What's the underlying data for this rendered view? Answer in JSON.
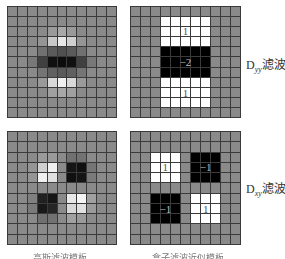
{
  "figure": {
    "panels": [
      {
        "id": "gaussian-dyy",
        "grid_size": 11,
        "base_gray": "#8a8a8a",
        "cells": [
          [
            2,
            4,
            "#9a9a9a"
          ],
          [
            2,
            5,
            "#a8a8a8"
          ],
          [
            2,
            6,
            "#9a9a9a"
          ],
          [
            3,
            3,
            "#959595"
          ],
          [
            3,
            4,
            "#c8c8c8"
          ],
          [
            3,
            5,
            "#e8e8e8"
          ],
          [
            3,
            6,
            "#d0d0d0"
          ],
          [
            3,
            7,
            "#959595"
          ],
          [
            4,
            3,
            "#707070"
          ],
          [
            4,
            4,
            "#5a5a5a"
          ],
          [
            4,
            5,
            "#505050"
          ],
          [
            4,
            6,
            "#5a5a5a"
          ],
          [
            4,
            7,
            "#707070"
          ],
          [
            5,
            2,
            "#787878"
          ],
          [
            5,
            3,
            "#404040"
          ],
          [
            5,
            4,
            "#101010"
          ],
          [
            5,
            5,
            "#0c0c0c"
          ],
          [
            5,
            6,
            "#101010"
          ],
          [
            5,
            7,
            "#404040"
          ],
          [
            5,
            8,
            "#787878"
          ],
          [
            6,
            3,
            "#757575"
          ],
          [
            6,
            4,
            "#606060"
          ],
          [
            6,
            5,
            "#5a5a5a"
          ],
          [
            6,
            6,
            "#606060"
          ],
          [
            6,
            7,
            "#757575"
          ],
          [
            7,
            3,
            "#9a9a9a"
          ],
          [
            7,
            4,
            "#d8d8d8"
          ],
          [
            7,
            5,
            "#f0f0f0"
          ],
          [
            7,
            6,
            "#d8d8d8"
          ],
          [
            7,
            7,
            "#9a9a9a"
          ],
          [
            8,
            4,
            "#a0a0a0"
          ],
          [
            8,
            5,
            "#a8a8a8"
          ],
          [
            8,
            6,
            "#a0a0a0"
          ]
        ]
      },
      {
        "id": "box-dyy",
        "grid_size": 11,
        "base_gray": "#8a8a8a",
        "regions": [
          {
            "rows": [
              1,
              3
            ],
            "cols": [
              3,
              7
            ],
            "color": "#ffffff",
            "value": "1"
          },
          {
            "rows": [
              4,
              6
            ],
            "cols": [
              3,
              7
            ],
            "color": "#000000",
            "value": "−2"
          },
          {
            "rows": [
              7,
              9
            ],
            "cols": [
              3,
              7
            ],
            "color": "#ffffff",
            "value": "1"
          }
        ]
      },
      {
        "id": "gaussian-dxy",
        "grid_size": 11,
        "base_gray": "#8a8a8a",
        "cells": [
          [
            2,
            3,
            "#9a9a9a"
          ],
          [
            2,
            4,
            "#9a9a9a"
          ],
          [
            2,
            6,
            "#707070"
          ],
          [
            2,
            7,
            "#727272"
          ],
          [
            3,
            2,
            "#959595"
          ],
          [
            3,
            3,
            "#d0d0d0"
          ],
          [
            3,
            4,
            "#f0f0f0"
          ],
          [
            3,
            6,
            "#151515"
          ],
          [
            3,
            7,
            "#101010"
          ],
          [
            3,
            8,
            "#757575"
          ],
          [
            4,
            2,
            "#959595"
          ],
          [
            4,
            3,
            "#f0f0f0"
          ],
          [
            4,
            4,
            "#e0e0e0"
          ],
          [
            4,
            6,
            "#101010"
          ],
          [
            4,
            7,
            "#151515"
          ],
          [
            4,
            8,
            "#7a7a7a"
          ],
          [
            6,
            2,
            "#808080"
          ],
          [
            6,
            3,
            "#202020"
          ],
          [
            6,
            4,
            "#151515"
          ],
          [
            6,
            6,
            "#e8e8e8"
          ],
          [
            6,
            7,
            "#f5f5f5"
          ],
          [
            6,
            8,
            "#a0a0a0"
          ],
          [
            7,
            2,
            "#7a7a7a"
          ],
          [
            7,
            3,
            "#181818"
          ],
          [
            7,
            4,
            "#252525"
          ],
          [
            7,
            6,
            "#d8d8d8"
          ],
          [
            7,
            7,
            "#e0e0e0"
          ],
          [
            7,
            8,
            "#9a9a9a"
          ],
          [
            8,
            3,
            "#707070"
          ],
          [
            8,
            4,
            "#727272"
          ],
          [
            8,
            6,
            "#a0a0a0"
          ],
          [
            8,
            7,
            "#9a9a9a"
          ]
        ]
      },
      {
        "id": "box-dxy",
        "grid_size": 11,
        "base_gray": "#8a8a8a",
        "regions": [
          {
            "rows": [
              2,
              4
            ],
            "cols": [
              2,
              4
            ],
            "color": "#ffffff",
            "value": "1"
          },
          {
            "rows": [
              2,
              4
            ],
            "cols": [
              6,
              8
            ],
            "color": "#000000",
            "value": "−1"
          },
          {
            "rows": [
              6,
              8
            ],
            "cols": [
              2,
              4
            ],
            "color": "#000000",
            "value": "−1"
          },
          {
            "rows": [
              6,
              8
            ],
            "cols": [
              6,
              8
            ],
            "color": "#ffffff",
            "value": "1"
          }
        ]
      }
    ],
    "labels": {
      "dyy": {
        "base": "D",
        "sub": "yy",
        "suffix": "滤波"
      },
      "dxy": {
        "base": "D",
        "sub": "xy",
        "suffix": "滤波"
      }
    },
    "captions": {
      "left": "高斯滤波模板",
      "right": "盒子滤波近似模板"
    }
  }
}
